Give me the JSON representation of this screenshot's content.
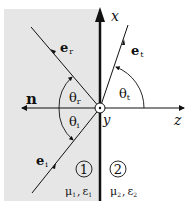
{
  "colors": {
    "medium1_fill": "#e6e6e6",
    "line": "#111111",
    "background": "#ffffff"
  },
  "axes": {
    "x_label": "x",
    "y_label": "y",
    "z_label": "z",
    "normal_label": "n"
  },
  "rays": {
    "reflected": {
      "label_main": "e",
      "label_sub": "r"
    },
    "incident": {
      "label_main": "e",
      "label_sub": "i"
    },
    "transmitted": {
      "label_main": "e",
      "label_sub": "t"
    }
  },
  "angles": {
    "reflected": {
      "main": "θ",
      "sub": "r"
    },
    "incident": {
      "main": "θ",
      "sub": "i"
    },
    "transmitted": {
      "main": "θ",
      "sub": "t"
    }
  },
  "media": [
    {
      "number": "1",
      "mu": "μ",
      "mu_sub": "1",
      "sep": ",",
      "eps": "ε",
      "eps_sub": "1"
    },
    {
      "number": "2",
      "mu": "μ",
      "mu_sub": "2",
      "sep": ",",
      "eps": "ε",
      "eps_sub": "2"
    }
  ]
}
